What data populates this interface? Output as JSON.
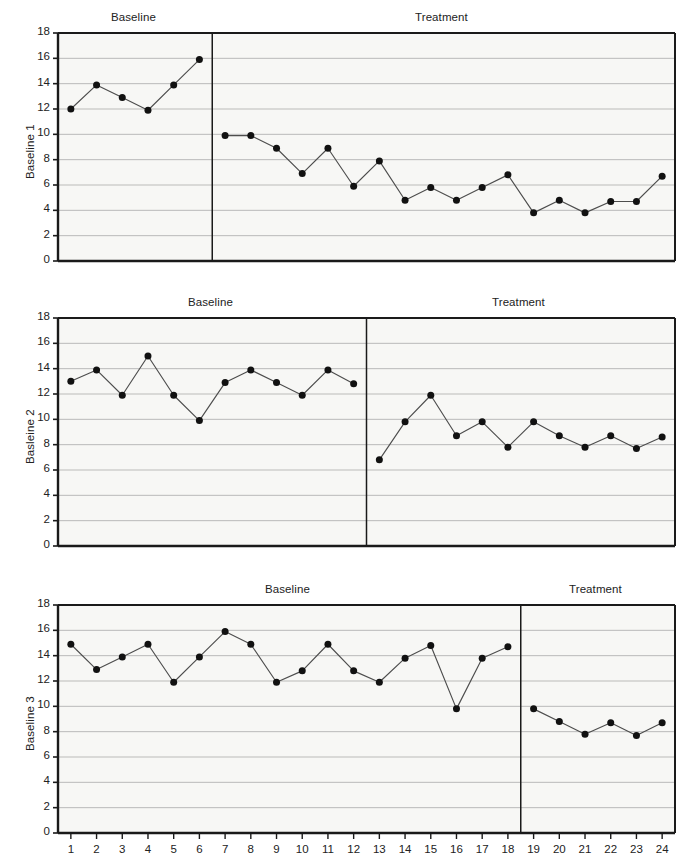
{
  "figure": {
    "type": "multiple-baseline-design",
    "background": "#ffffff",
    "line_color": "#4d4d4d",
    "marker_color": "#111111",
    "axis_color": "#1a1a1a",
    "grid_color": "#b3b3b3"
  },
  "labels": {
    "baseline_phase": "Baseline",
    "treatment_phase": "Treatment"
  },
  "chart_data": {
    "type": "line",
    "title": "",
    "xlabel": "",
    "ylabel": "",
    "xlim": [
      0.5,
      24.5
    ],
    "ylim": [
      0,
      18
    ],
    "ytick_values": [
      0,
      2,
      4,
      6,
      8,
      10,
      12,
      14,
      16,
      18
    ],
    "ytick_labels": [
      "0",
      "2",
      "4",
      "6",
      "8",
      "10",
      "12",
      "14",
      "16",
      "18"
    ],
    "x": [
      1,
      2,
      3,
      4,
      5,
      6,
      7,
      8,
      9,
      10,
      11,
      12,
      13,
      14,
      15,
      16,
      17,
      18,
      19,
      20,
      21,
      22,
      23,
      24
    ],
    "xtick_labels": [
      "1",
      "2",
      "3",
      "4",
      "5",
      "6",
      "7",
      "8",
      "9",
      "10",
      "11",
      "12",
      "13",
      "14",
      "15",
      "16",
      "17",
      "18",
      "19",
      "20",
      "21",
      "22",
      "23",
      "24"
    ],
    "grid": true,
    "legend": "none",
    "panels": [
      {
        "ylabel": "Baseline 1",
        "phase_change_after_session": 6,
        "phase_labels": [
          "Baseline",
          "Treatment"
        ],
        "series": [
          {
            "name": "Baseline",
            "x": [
              1,
              2,
              3,
              4,
              5,
              6
            ],
            "values": [
              12.0,
              13.9,
              12.9,
              11.9,
              13.9,
              15.9
            ]
          },
          {
            "name": "Treatment",
            "x": [
              7,
              8,
              9,
              10,
              11,
              12,
              13,
              14,
              15,
              16,
              17,
              18,
              19,
              20,
              21,
              22,
              23,
              24
            ],
            "values": [
              9.9,
              9.9,
              8.9,
              6.9,
              8.9,
              5.9,
              7.9,
              4.8,
              5.8,
              4.8,
              5.8,
              6.8,
              3.8,
              4.8,
              3.8,
              4.7,
              4.7,
              6.7
            ]
          }
        ]
      },
      {
        "ylabel": "Basleine 2",
        "phase_change_after_session": 12,
        "phase_labels": [
          "Baseline",
          "Treatment"
        ],
        "series": [
          {
            "name": "Baseline",
            "x": [
              1,
              2,
              3,
              4,
              5,
              6,
              7,
              8,
              9,
              10,
              11,
              12
            ],
            "values": [
              13.0,
              13.9,
              11.9,
              15.0,
              11.9,
              9.9,
              12.9,
              13.9,
              12.9,
              11.9,
              13.9,
              12.8
            ]
          },
          {
            "name": "Treatment",
            "x": [
              13,
              14,
              15,
              16,
              17,
              18,
              19,
              20,
              21,
              22,
              23,
              24
            ],
            "values": [
              6.8,
              9.8,
              11.9,
              8.7,
              9.8,
              7.8,
              9.8,
              8.7,
              7.8,
              8.7,
              7.7,
              8.6
            ]
          }
        ]
      },
      {
        "ylabel": "Baseline 3",
        "phase_change_after_session": 18,
        "phase_labels": [
          "Baseline",
          "Treatment"
        ],
        "series": [
          {
            "name": "Baseline",
            "x": [
              1,
              2,
              3,
              4,
              5,
              6,
              7,
              8,
              9,
              10,
              11,
              12,
              13,
              14,
              15,
              16,
              17,
              18
            ],
            "values": [
              14.9,
              12.9,
              13.9,
              14.9,
              11.9,
              13.9,
              15.9,
              14.9,
              11.9,
              12.8,
              14.9,
              12.8,
              11.9,
              13.8,
              14.8,
              9.8,
              13.8,
              14.7
            ]
          },
          {
            "name": "Treatment",
            "x": [
              19,
              20,
              21,
              22,
              23,
              24
            ],
            "values": [
              9.8,
              8.8,
              7.8,
              8.7,
              7.7,
              8.7
            ]
          }
        ]
      }
    ]
  }
}
